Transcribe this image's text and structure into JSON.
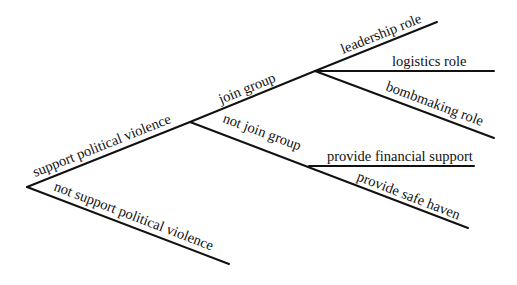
{
  "diagram": {
    "type": "decision-tree",
    "nodes": {
      "root": {
        "x": 27,
        "y": 187
      },
      "support": {
        "x": 190,
        "y": 122
      },
      "join": {
        "x": 315,
        "y": 71
      },
      "notjoin": {
        "x": 309,
        "y": 166
      }
    },
    "edges": [
      {
        "id": "support",
        "label": "support political violence",
        "from": [
          27,
          187
        ],
        "to": [
          190,
          122
        ]
      },
      {
        "id": "not-support",
        "label": "not support political violence",
        "from": [
          27,
          187
        ],
        "to": [
          229,
          264
        ]
      },
      {
        "id": "join",
        "label": "join group",
        "from": [
          190,
          122
        ],
        "to": [
          315,
          71
        ]
      },
      {
        "id": "not-join",
        "label": "not join group",
        "from": [
          190,
          122
        ],
        "to": [
          309,
          166
        ]
      },
      {
        "id": "leadership",
        "label": "leadership role",
        "from": [
          315,
          71
        ],
        "to": [
          437,
          22
        ]
      },
      {
        "id": "logistics",
        "label": "logistics role",
        "from": [
          315,
          71
        ],
        "to": [
          494,
          71
        ]
      },
      {
        "id": "bombmaking",
        "label": "bombmaking role",
        "from": [
          315,
          71
        ],
        "to": [
          494,
          138
        ]
      },
      {
        "id": "financial",
        "label": "provide financial support",
        "from": [
          309,
          166
        ],
        "to": [
          474,
          166
        ]
      },
      {
        "id": "safe-haven",
        "label": "provide safe haven",
        "from": [
          309,
          166
        ],
        "to": [
          468,
          228
        ]
      }
    ]
  },
  "labels": {
    "support": "support political violence",
    "not_support": "not support political violence",
    "join": "join group",
    "not_join": "not join group",
    "leadership": "leadership role",
    "logistics": "logistics role",
    "bombmaking": "bombmaking role",
    "financial": "provide financial support",
    "safe_haven": "provide safe haven"
  }
}
